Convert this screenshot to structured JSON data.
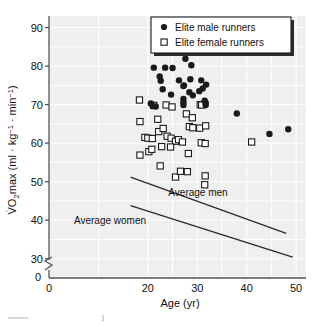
{
  "chart_data": {
    "type": "scatter",
    "title": "",
    "xlabel": "Age (yr)",
    "ylabel": "V̇O₂max (ml · kg⁻¹ · min⁻¹)",
    "xlim": [
      0,
      52
    ],
    "ylim": [
      25,
      93
    ],
    "y_axis_break": true,
    "y_break_label": "0",
    "grid": true,
    "legend_position": "top-right",
    "xticks": [
      0,
      20,
      30,
      40,
      50
    ],
    "xtick_labels": [
      "0",
      "20",
      "30",
      "40",
      "50"
    ],
    "yticks": [
      30,
      40,
      50,
      60,
      70,
      80,
      90
    ],
    "ytick_labels": [
      "30",
      "40",
      "50",
      "60",
      "70",
      "80",
      "90"
    ],
    "series": [
      {
        "name": "Elite male runners",
        "marker": "filled-circle",
        "color": "#1a1a1a",
        "points": [
          [
            23.3,
            84.2
          ],
          [
            21.2,
            79.6
          ],
          [
            23.5,
            79.6
          ],
          [
            25.0,
            79.5
          ],
          [
            27.6,
            81.9
          ],
          [
            28.8,
            80.2
          ],
          [
            22.4,
            77.3
          ],
          [
            22.6,
            76.2
          ],
          [
            23.0,
            74.0
          ],
          [
            26.3,
            76.3
          ],
          [
            27.3,
            75.0
          ],
          [
            28.6,
            76.6
          ],
          [
            30.8,
            76.3
          ],
          [
            31.8,
            75.2
          ],
          [
            24.7,
            72.6
          ],
          [
            27.2,
            74.8
          ],
          [
            28.4,
            73.2
          ],
          [
            30.4,
            73.5
          ],
          [
            31.1,
            74.2
          ],
          [
            20.6,
            70.3
          ],
          [
            21.0,
            69.6
          ],
          [
            21.6,
            69.5
          ],
          [
            27.2,
            71.5
          ],
          [
            27.2,
            70.6
          ],
          [
            27.2,
            69.9
          ],
          [
            29.1,
            72.4
          ],
          [
            31.5,
            71.0
          ],
          [
            31.7,
            70.5
          ],
          [
            31.7,
            69.9
          ],
          [
            38.0,
            67.7
          ],
          [
            44.6,
            62.4
          ],
          [
            48.4,
            63.6
          ]
        ]
      },
      {
        "name": "Elite female runners",
        "marker": "open-square",
        "color": "#1a1a1a",
        "points": [
          [
            18.3,
            71.2
          ],
          [
            21.2,
            69.8
          ],
          [
            23.7,
            69.9
          ],
          [
            24.9,
            69.4
          ],
          [
            18.4,
            65.6
          ],
          [
            22.0,
            66.2
          ],
          [
            27.8,
            67.6
          ],
          [
            29.0,
            66.6
          ],
          [
            30.6,
            70.0
          ],
          [
            30.9,
            69.9
          ],
          [
            19.4,
            61.5
          ],
          [
            20.0,
            61.3
          ],
          [
            20.9,
            61.2
          ],
          [
            22.2,
            63.0
          ],
          [
            23.1,
            63.8
          ],
          [
            23.9,
            61.8
          ],
          [
            24.7,
            61.3
          ],
          [
            25.6,
            60.5
          ],
          [
            26.2,
            60.9
          ],
          [
            27.0,
            60.3
          ],
          [
            28.4,
            64.3
          ],
          [
            29.1,
            64.0
          ],
          [
            30.5,
            63.9
          ],
          [
            31.7,
            64.5
          ],
          [
            18.4,
            56.9
          ],
          [
            20.2,
            57.8
          ],
          [
            20.8,
            58.4
          ],
          [
            22.8,
            59.1
          ],
          [
            24.6,
            59.0
          ],
          [
            28.2,
            57.3
          ],
          [
            30.8,
            60.1
          ],
          [
            31.6,
            59.9
          ],
          [
            22.5,
            54.1
          ],
          [
            25.6,
            51.2
          ],
          [
            26.6,
            52.7
          ],
          [
            28.0,
            52.6
          ],
          [
            31.6,
            51.5
          ],
          [
            31.5,
            49.2
          ],
          [
            41.0,
            60.3
          ]
        ]
      }
    ],
    "annotations": [
      {
        "label": "Average men",
        "line_start": [
          16.5,
          51.2
        ],
        "line_end": [
          48.0,
          36.6
        ]
      },
      {
        "label": "Average women",
        "line_start": [
          16.5,
          43.8
        ],
        "line_end": [
          49.3,
          30.4
        ]
      }
    ],
    "legend_entries": [
      {
        "label": "Elite male runners",
        "marker": "filled-circle"
      },
      {
        "label": "Elite female runners",
        "marker": "open-square"
      }
    ]
  }
}
